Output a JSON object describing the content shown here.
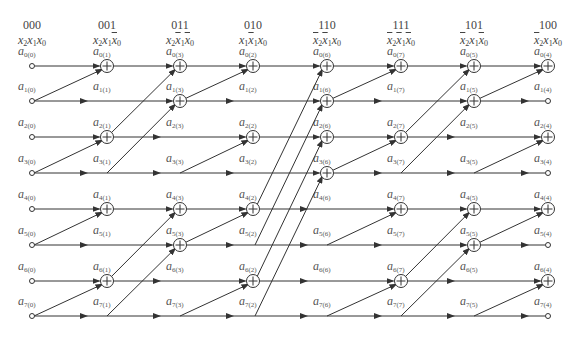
{
  "diagram": {
    "type": "butterfly-signal-flow-graph",
    "columns": [
      {
        "code": "000",
        "expr": [
          {
            "v": "x",
            "s": "2",
            "bar": false
          },
          {
            "v": "x",
            "s": "1",
            "bar": false
          },
          {
            "v": "x",
            "s": "0",
            "bar": false
          }
        ],
        "sub": "0"
      },
      {
        "code": "001",
        "expr": [
          {
            "v": "x",
            "s": "2",
            "bar": false
          },
          {
            "v": "x",
            "s": "1",
            "bar": false
          },
          {
            "v": "x",
            "s": "0",
            "bar": true
          }
        ],
        "sub": "1"
      },
      {
        "code": "011",
        "expr": [
          {
            "v": "x",
            "s": "2",
            "bar": false
          },
          {
            "v": "x",
            "s": "1",
            "bar": true
          },
          {
            "v": "x",
            "s": "0",
            "bar": true
          }
        ],
        "sub": "3"
      },
      {
        "code": "010",
        "expr": [
          {
            "v": "x",
            "s": "1",
            "bar": false
          },
          {
            "v": "x",
            "s": "1",
            "bar": true
          },
          {
            "v": "x",
            "s": "0",
            "bar": false
          }
        ],
        "sub": "2"
      },
      {
        "code": "110",
        "expr": [
          {
            "v": "x",
            "s": "2",
            "bar": true
          },
          {
            "v": "x",
            "s": "1",
            "bar": true
          },
          {
            "v": "x",
            "s": "0",
            "bar": false
          }
        ],
        "sub": "6"
      },
      {
        "code": "111",
        "expr": [
          {
            "v": "x",
            "s": "2",
            "bar": true
          },
          {
            "v": "x",
            "s": "1",
            "bar": true
          },
          {
            "v": "x",
            "s": "0",
            "bar": true
          }
        ],
        "sub": "7"
      },
      {
        "code": "101",
        "expr": [
          {
            "v": "x",
            "s": "2",
            "bar": true
          },
          {
            "v": "x",
            "s": "1",
            "bar": false
          },
          {
            "v": "x",
            "s": "0",
            "bar": true
          }
        ],
        "sub": "5"
      },
      {
        "code": "100",
        "expr": [
          {
            "v": "x",
            "s": "2",
            "bar": true
          },
          {
            "v": "x",
            "s": "1",
            "bar": false
          },
          {
            "v": "x",
            "s": "0",
            "bar": false
          }
        ],
        "sub": "4"
      }
    ],
    "rows": [
      "0",
      "1",
      "2",
      "3",
      "4",
      "5",
      "6",
      "7"
    ],
    "node_symbol": "a",
    "stages": [
      {
        "from": 0,
        "to": 1,
        "pairs": [
          [
            1,
            0
          ],
          [
            3,
            2
          ],
          [
            5,
            4
          ],
          [
            7,
            6
          ]
        ]
      },
      {
        "from": 1,
        "to": 2,
        "pairs": [
          [
            2,
            0
          ],
          [
            3,
            1
          ],
          [
            6,
            4
          ],
          [
            7,
            5
          ]
        ]
      },
      {
        "from": 2,
        "to": 3,
        "pairs": [
          [
            1,
            0
          ],
          [
            3,
            2
          ],
          [
            5,
            4
          ],
          [
            7,
            6
          ]
        ]
      },
      {
        "from": 3,
        "to": 4,
        "pairs": [
          [
            4,
            0
          ],
          [
            5,
            1
          ],
          [
            6,
            2
          ],
          [
            7,
            3
          ]
        ]
      },
      {
        "from": 4,
        "to": 5,
        "pairs": [
          [
            1,
            0
          ],
          [
            3,
            2
          ],
          [
            5,
            4
          ],
          [
            7,
            6
          ]
        ]
      },
      {
        "from": 5,
        "to": 6,
        "pairs": [
          [
            2,
            0
          ],
          [
            3,
            1
          ],
          [
            6,
            4
          ],
          [
            7,
            5
          ]
        ]
      },
      {
        "from": 6,
        "to": 7,
        "pairs": [
          [
            1,
            0
          ],
          [
            3,
            2
          ],
          [
            5,
            4
          ],
          [
            7,
            6
          ]
        ]
      }
    ],
    "colors": {
      "line": "#333333",
      "text": "#555555"
    }
  }
}
